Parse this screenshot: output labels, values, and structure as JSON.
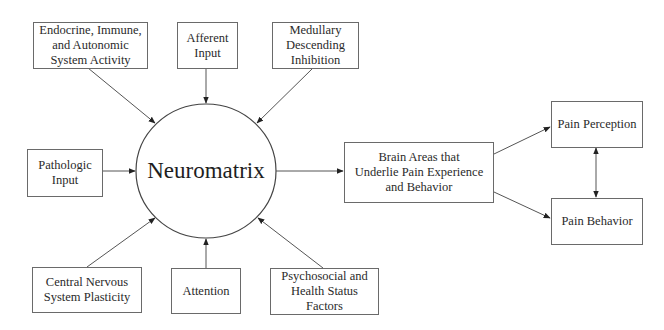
{
  "diagram": {
    "center_node": "Neuromatrix",
    "input_nodes": [
      {
        "id": "endocrine",
        "label": "Endocrine, Immune,\nand Autonomic\nSystem Activity"
      },
      {
        "id": "afferent",
        "label": "Afferent\nInput"
      },
      {
        "id": "medullary",
        "label": "Medullary\nDescending\nInhibition"
      },
      {
        "id": "pathologic",
        "label": "Pathologic\nInput"
      },
      {
        "id": "cns",
        "label": "Central Nervous\nSystem Plasticity"
      },
      {
        "id": "attention",
        "label": "Attention"
      },
      {
        "id": "psychosocial",
        "label": "Psychosocial and\nHealth Status\nFactors"
      }
    ],
    "output_nodes": [
      {
        "id": "brain",
        "label": "Brain Areas that\nUnderlie Pain Experience\nand Behavior"
      },
      {
        "id": "perception",
        "label": "Pain Perception"
      },
      {
        "id": "behavior",
        "label": "Pain Behavior"
      }
    ],
    "edges": [
      {
        "from": "Endocrine, Immune, and Autonomic System Activity",
        "to": "Neuromatrix",
        "type": "directed"
      },
      {
        "from": "Afferent Input",
        "to": "Neuromatrix",
        "type": "directed"
      },
      {
        "from": "Medullary Descending Inhibition",
        "to": "Neuromatrix",
        "type": "directed"
      },
      {
        "from": "Pathologic Input",
        "to": "Neuromatrix",
        "type": "directed"
      },
      {
        "from": "Central Nervous System Plasticity",
        "to": "Neuromatrix",
        "type": "directed"
      },
      {
        "from": "Attention",
        "to": "Neuromatrix",
        "type": "directed"
      },
      {
        "from": "Psychosocial and Health Status Factors",
        "to": "Neuromatrix",
        "type": "directed"
      },
      {
        "from": "Neuromatrix",
        "to": "Brain Areas that Underlie Pain Experience and Behavior",
        "type": "directed"
      },
      {
        "from": "Brain Areas that Underlie Pain Experience and Behavior",
        "to": "Pain Perception",
        "type": "directed"
      },
      {
        "from": "Brain Areas that Underlie Pain Experience and Behavior",
        "to": "Pain Behavior",
        "type": "directed"
      },
      {
        "from": "Pain Perception",
        "to": "Pain Behavior",
        "type": "bidirectional"
      }
    ]
  }
}
